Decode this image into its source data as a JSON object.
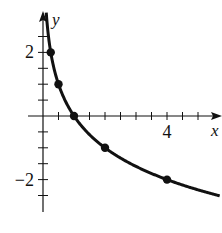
{
  "chart_data": {
    "type": "line",
    "title": "",
    "xlabel": "x",
    "ylabel": "y",
    "function": "y = log_{1/2}(x)",
    "xlim": [
      -0.5,
      5.8
    ],
    "ylim": [
      -3,
      3.3
    ],
    "x_tick_step": 0.5,
    "y_tick_step": 0.5,
    "x_tick_labels": [
      {
        "value": 4,
        "label": "4"
      }
    ],
    "y_tick_labels": [
      {
        "value": 2,
        "label": "2"
      },
      {
        "value": -2,
        "label": "−2"
      }
    ],
    "grid": false,
    "legend": null,
    "series": [
      {
        "name": "curve",
        "marked_points": [
          {
            "x": 0.25,
            "y": 2
          },
          {
            "x": 0.5,
            "y": 1
          },
          {
            "x": 1,
            "y": 0
          },
          {
            "x": 2,
            "y": -1
          },
          {
            "x": 4,
            "y": -2
          }
        ]
      }
    ],
    "colors": {
      "line": "#111111",
      "axis": "#111111",
      "background": "#ffffff"
    }
  }
}
